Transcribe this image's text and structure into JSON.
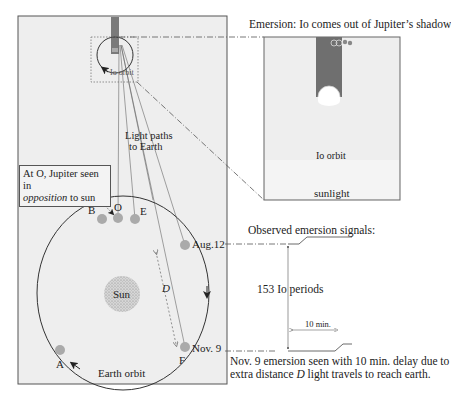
{
  "diagram": {
    "colors": {
      "panel_fill": "#eeeeee",
      "panel_border": "#555555",
      "jupiter_shadow": "#777777",
      "earth_dot": "#aaaaaa",
      "sun_fill": "#c8c8c8",
      "line": "#333333",
      "light_path": "#666666"
    },
    "main_panel": {
      "io_orbit_label": "Io orbit",
      "light_paths_label_line1": "Light paths",
      "light_paths_label_line2": "to Earth",
      "callout_text_1": "At O, Jupiter seen in",
      "callout_text_italic": "opposition",
      "callout_text_2": " to sun",
      "sun_label": "Sun",
      "earth_orbit_label": "Earth orbit",
      "distance_label": "D",
      "earth_positions": [
        {
          "id": "B",
          "label": "B"
        },
        {
          "id": "O",
          "label": "O"
        },
        {
          "id": "E",
          "label": "E"
        },
        {
          "id": "aug12",
          "label": "Aug.12"
        },
        {
          "id": "F",
          "label": "F"
        },
        {
          "id": "A",
          "label": "A"
        }
      ],
      "nov9_label": "Nov. 9"
    },
    "inset": {
      "title": "Emersion: Io comes out of Jupiter’s shadow",
      "io_orbit_label": "Io orbit",
      "sunlight_label": "sunlight"
    },
    "signals": {
      "title": "Observed emersion signals:",
      "periods_label": "153 Io periods",
      "delay_label": "10 min.",
      "caption_line1": "Nov. 9 emersion seen with 10 min. delay due to",
      "caption_line2_pre": "extra distance ",
      "caption_line2_italic": "D",
      "caption_line2_post": " light travels to reach earth."
    }
  }
}
